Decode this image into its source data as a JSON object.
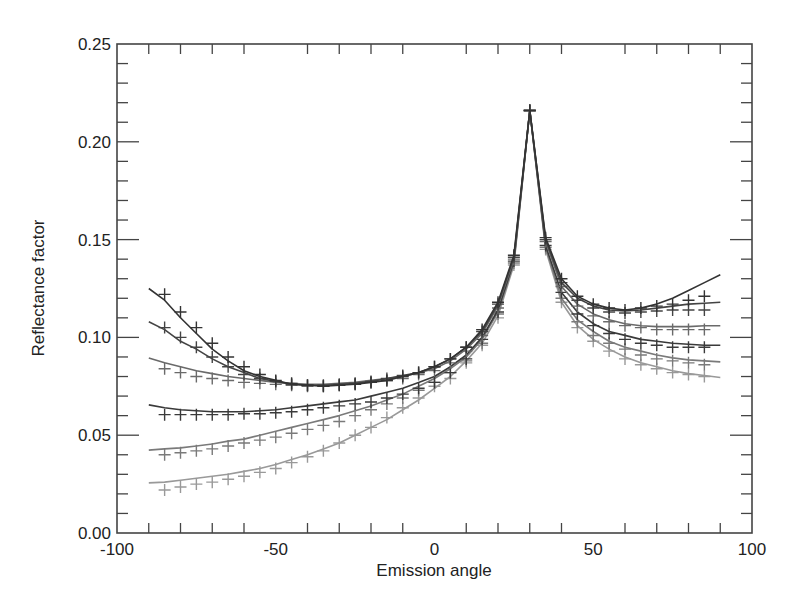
{
  "chart_data": {
    "type": "line",
    "title": "",
    "xlabel": "Emission angle",
    "ylabel": "Reflectance factor",
    "xlim": [
      -100,
      100
    ],
    "ylim": [
      0.0,
      0.25
    ],
    "grid": false,
    "legend": null,
    "x_ticks": [
      "-100",
      "-50",
      "0",
      "50",
      "100"
    ],
    "y_ticks": [
      "0.00",
      "0.05",
      "0.10",
      "0.15",
      "0.20",
      "0.25"
    ],
    "x": [
      -90,
      -85,
      -80,
      -75,
      -70,
      -65,
      -60,
      -55,
      -50,
      -45,
      -40,
      -35,
      -30,
      -25,
      -20,
      -15,
      -10,
      -5,
      0,
      5,
      10,
      15,
      20,
      25,
      30,
      35,
      40,
      45,
      50,
      55,
      60,
      65,
      70,
      75,
      80,
      85,
      90
    ],
    "marker_x": [
      -85,
      -80,
      -75,
      -70,
      -65,
      -60,
      -55,
      -50,
      -45,
      -40,
      -35,
      -30,
      -25,
      -20,
      -15,
      -10,
      -5,
      0,
      5,
      10,
      15,
      20,
      25,
      30,
      35,
      40,
      45,
      50,
      55,
      60,
      65,
      70,
      75,
      80,
      85
    ],
    "series": [
      {
        "name": "curve 1",
        "color": "#333333",
        "line": [
          0.125,
          0.119,
          0.11,
          0.102,
          0.094,
          0.088,
          0.083,
          0.08,
          0.078,
          0.076,
          0.0755,
          0.075,
          0.0755,
          0.076,
          0.077,
          0.078,
          0.08,
          0.082,
          0.085,
          0.089,
          0.095,
          0.104,
          0.118,
          0.142,
          0.216,
          0.151,
          0.13,
          0.121,
          0.117,
          0.115,
          0.114,
          0.115,
          0.117,
          0.12,
          0.124,
          0.128,
          0.132
        ],
        "markers": [
          0.122,
          0.113,
          0.105,
          0.097,
          0.09,
          0.085,
          0.081,
          0.078,
          0.0765,
          0.0755,
          0.075,
          0.0755,
          0.076,
          0.077,
          0.078,
          0.08,
          0.082,
          0.085,
          0.089,
          0.095,
          0.104,
          0.118,
          0.142,
          0.216,
          0.151,
          0.13,
          0.121,
          0.117,
          0.115,
          0.114,
          0.115,
          0.116,
          0.117,
          0.119,
          0.121
        ]
      },
      {
        "name": "curve 2",
        "color": "#444444",
        "line": [
          0.108,
          0.104,
          0.098,
          0.094,
          0.089,
          0.085,
          0.082,
          0.079,
          0.0775,
          0.076,
          0.0755,
          0.0755,
          0.076,
          0.0765,
          0.0775,
          0.079,
          0.0805,
          0.082,
          0.085,
          0.089,
          0.095,
          0.103,
          0.117,
          0.141,
          0.216,
          0.15,
          0.128,
          0.12,
          0.116,
          0.114,
          0.1135,
          0.114,
          0.115,
          0.116,
          0.117,
          0.1175,
          0.118
        ],
        "markers": [
          0.105,
          0.1,
          0.095,
          0.09,
          0.085,
          0.081,
          0.079,
          0.0775,
          0.076,
          0.0755,
          0.0755,
          0.076,
          0.0765,
          0.0775,
          0.079,
          0.0805,
          0.082,
          0.085,
          0.089,
          0.095,
          0.103,
          0.117,
          0.141,
          0.216,
          0.15,
          0.128,
          0.119,
          0.115,
          0.113,
          0.1125,
          0.113,
          0.1135,
          0.114,
          0.114,
          0.114
        ]
      },
      {
        "name": "curve 3",
        "color": "#6a6a6a",
        "line": [
          0.0895,
          0.087,
          0.085,
          0.083,
          0.0815,
          0.08,
          0.079,
          0.078,
          0.077,
          0.0765,
          0.076,
          0.076,
          0.0765,
          0.077,
          0.078,
          0.079,
          0.08,
          0.082,
          0.084,
          0.088,
          0.094,
          0.102,
          0.116,
          0.14,
          0.216,
          0.149,
          0.126,
          0.117,
          0.112,
          0.109,
          0.107,
          0.106,
          0.1055,
          0.1055,
          0.1055,
          0.106,
          0.106
        ],
        "markers": [
          0.084,
          0.082,
          0.08,
          0.079,
          0.078,
          0.077,
          0.0765,
          0.076,
          0.0755,
          0.075,
          0.075,
          0.0755,
          0.076,
          0.077,
          0.078,
          0.079,
          0.081,
          0.083,
          0.087,
          0.093,
          0.101,
          0.115,
          0.14,
          0.216,
          0.149,
          0.126,
          0.116,
          0.111,
          0.108,
          0.106,
          0.105,
          0.104,
          0.104,
          0.104,
          0.104
        ]
      },
      {
        "name": "curve 4",
        "color": "#3a3a3a",
        "line": [
          0.0655,
          0.064,
          0.063,
          0.0625,
          0.062,
          0.062,
          0.062,
          0.0625,
          0.063,
          0.064,
          0.065,
          0.066,
          0.067,
          0.068,
          0.07,
          0.072,
          0.074,
          0.077,
          0.08,
          0.085,
          0.091,
          0.1,
          0.114,
          0.139,
          0.216,
          0.147,
          0.123,
          0.113,
          0.107,
          0.103,
          0.101,
          0.099,
          0.098,
          0.097,
          0.0965,
          0.096,
          0.096
        ],
        "markers": [
          0.0605,
          0.0605,
          0.0605,
          0.0605,
          0.0605,
          0.061,
          0.061,
          0.0615,
          0.062,
          0.063,
          0.064,
          0.065,
          0.066,
          0.067,
          0.069,
          0.071,
          0.074,
          0.077,
          0.082,
          0.089,
          0.099,
          0.113,
          0.139,
          0.216,
          0.147,
          0.123,
          0.112,
          0.106,
          0.102,
          0.099,
          0.097,
          0.096,
          0.095,
          0.095,
          0.095
        ]
      },
      {
        "name": "curve 5",
        "color": "#7a7a7a",
        "line": [
          0.0424,
          0.043,
          0.0435,
          0.0445,
          0.0455,
          0.047,
          0.048,
          0.05,
          0.052,
          0.054,
          0.056,
          0.058,
          0.06,
          0.0625,
          0.065,
          0.068,
          0.071,
          0.075,
          0.079,
          0.084,
          0.09,
          0.099,
          0.113,
          0.138,
          0.216,
          0.146,
          0.12,
          0.109,
          0.103,
          0.098,
          0.095,
          0.093,
          0.091,
          0.0895,
          0.0885,
          0.088,
          0.0875
        ],
        "markers": [
          0.04,
          0.041,
          0.042,
          0.043,
          0.0445,
          0.046,
          0.0475,
          0.049,
          0.051,
          0.053,
          0.055,
          0.057,
          0.06,
          0.063,
          0.066,
          0.069,
          0.073,
          0.077,
          0.082,
          0.088,
          0.097,
          0.112,
          0.138,
          0.216,
          0.146,
          0.12,
          0.108,
          0.101,
          0.097,
          0.094,
          0.091,
          0.089,
          0.088,
          0.087,
          0.086
        ]
      },
      {
        "name": "curve 6",
        "color": "#999999",
        "line": [
          0.0256,
          0.026,
          0.027,
          0.028,
          0.029,
          0.03,
          0.0315,
          0.033,
          0.035,
          0.0375,
          0.04,
          0.043,
          0.046,
          0.05,
          0.054,
          0.058,
          0.063,
          0.068,
          0.074,
          0.08,
          0.088,
          0.097,
          0.111,
          0.137,
          0.216,
          0.145,
          0.118,
          0.106,
          0.099,
          0.094,
          0.09,
          0.087,
          0.085,
          0.083,
          0.0815,
          0.0805,
          0.0795
        ],
        "markers": [
          0.022,
          0.0235,
          0.025,
          0.026,
          0.0275,
          0.029,
          0.031,
          0.033,
          0.036,
          0.039,
          0.042,
          0.046,
          0.05,
          0.054,
          0.059,
          0.064,
          0.069,
          0.075,
          0.079,
          0.087,
          0.096,
          0.11,
          0.137,
          0.216,
          0.145,
          0.118,
          0.105,
          0.098,
          0.093,
          0.089,
          0.086,
          0.084,
          0.082,
          0.081,
          0.08
        ]
      }
    ]
  }
}
